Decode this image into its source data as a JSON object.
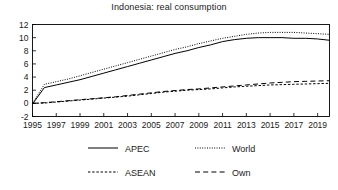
{
  "chart_data": {
    "type": "line",
    "title": "Indonesia: real consumption",
    "xlabel": "",
    "ylabel": "",
    "grid": false,
    "legend_position": "below",
    "xlim": [
      1995,
      2020
    ],
    "ylim": [
      -2,
      12
    ],
    "yticks": [
      -2,
      0,
      2,
      4,
      6,
      8,
      10,
      12
    ],
    "ytick_labels": [
      "-2",
      "0",
      "2",
      "4",
      "6",
      "8",
      "10",
      "12"
    ],
    "xticks": [
      1995,
      1997,
      1999,
      2001,
      2003,
      2005,
      2007,
      2009,
      2011,
      2013,
      2015,
      2017,
      2019
    ],
    "xtick_labels": [
      "1995",
      "1997",
      "1999",
      "2001",
      "2003",
      "2005",
      "2007",
      "2009",
      "2011",
      "2013",
      "2015",
      "2017",
      "2019"
    ],
    "x": [
      1995,
      1996,
      1997,
      1998,
      1999,
      2000,
      2001,
      2002,
      2003,
      2004,
      2005,
      2006,
      2007,
      2008,
      2009,
      2010,
      2011,
      2012,
      2013,
      2014,
      2015,
      2016,
      2017,
      2018,
      2019,
      2020
    ],
    "series": [
      {
        "name": "APEC",
        "style": "solid",
        "color": "#000000",
        "values": [
          -0.1,
          2.4,
          2.8,
          3.2,
          3.6,
          4.1,
          4.6,
          5.1,
          5.6,
          6.1,
          6.6,
          7.1,
          7.6,
          8.0,
          8.5,
          8.9,
          9.4,
          9.7,
          9.9,
          10.0,
          10.0,
          10.0,
          9.9,
          9.9,
          9.8,
          9.6
        ]
      },
      {
        "name": "World",
        "style": "dotted",
        "color": "#000000",
        "values": [
          0.0,
          2.9,
          3.3,
          3.7,
          4.2,
          4.7,
          5.2,
          5.7,
          6.2,
          6.7,
          7.2,
          7.7,
          8.2,
          8.6,
          9.1,
          9.5,
          9.9,
          10.2,
          10.5,
          10.7,
          10.8,
          10.8,
          10.8,
          10.7,
          10.6,
          10.5
        ]
      },
      {
        "name": "ASEAN",
        "style": "fine-dashed",
        "color": "#000000",
        "values": [
          0.0,
          0.05,
          0.2,
          0.35,
          0.5,
          0.65,
          0.8,
          0.95,
          1.1,
          1.3,
          1.5,
          1.7,
          1.85,
          2.0,
          2.1,
          2.2,
          2.35,
          2.5,
          2.6,
          2.7,
          2.8,
          2.85,
          2.9,
          2.95,
          3.0,
          3.05
        ]
      },
      {
        "name": "Own",
        "style": "long-dashed",
        "color": "#000000",
        "values": [
          0.0,
          0.1,
          0.25,
          0.4,
          0.55,
          0.7,
          0.85,
          1.0,
          1.2,
          1.4,
          1.6,
          1.8,
          1.95,
          2.1,
          2.2,
          2.35,
          2.5,
          2.65,
          2.8,
          2.95,
          3.1,
          3.2,
          3.3,
          3.35,
          3.4,
          3.45
        ]
      }
    ]
  },
  "legend": {
    "items": [
      {
        "label": "APEC",
        "style": "solid"
      },
      {
        "label": "World",
        "style": "dotted"
      },
      {
        "label": "ASEAN",
        "style": "fine-dashed"
      },
      {
        "label": "Own",
        "style": "long-dashed"
      }
    ]
  }
}
